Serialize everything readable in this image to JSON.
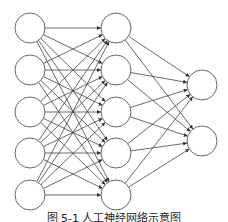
{
  "diagram": {
    "type": "fully-connected-neural-network",
    "layers": [
      {
        "name": "input",
        "x": 30,
        "nodes_y": [
          28,
          70,
          112,
          153,
          195
        ]
      },
      {
        "name": "hidden",
        "x": 116,
        "nodes_y": [
          28,
          70,
          112,
          153,
          195
        ]
      },
      {
        "name": "output",
        "x": 202,
        "nodes_y": [
          85,
          141
        ]
      }
    ],
    "node_radius": 15,
    "colors": {
      "edge": "#444444",
      "node_stroke": "#666666",
      "node_fill": "#ffffff"
    }
  },
  "caption": "图 5-1  人工神经网络示意图"
}
